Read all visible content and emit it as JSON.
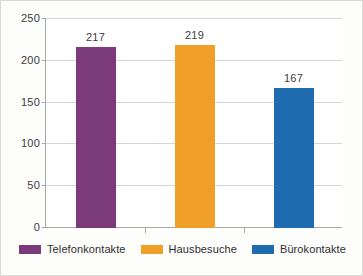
{
  "chart_data": {
    "type": "bar",
    "title": "",
    "subtitle": "",
    "xlabel": "",
    "ylabel": "",
    "categories": [
      "Telefonkontakte",
      "Hausbesuche",
      "Bürokontakte"
    ],
    "values": [
      217,
      219,
      167
    ],
    "value_labels": [
      "217",
      "219",
      "167"
    ],
    "series": [
      {
        "name": "Kontakte",
        "values": [
          217,
          219,
          167
        ]
      }
    ],
    "ylim": [
      0,
      250
    ],
    "ytick_values": [
      0,
      50,
      100,
      150,
      200,
      250
    ],
    "ytick_labels": [
      "0",
      "50",
      "100",
      "150",
      "200",
      "250"
    ],
    "grid": true,
    "grid_axis": "y",
    "legend_position": "bottom",
    "colors": {
      "telefonkontakte": "#7B3B7B",
      "hausbesuche": "#F0A028",
      "burokontakte": "#1F6BB0",
      "gridline": "#D6D6D6",
      "axis": "#A8A8A8",
      "text": "#3B3B3B",
      "background": "#FDFDFC",
      "plot_background": "#FFFFFF"
    }
  },
  "legend": {
    "items": [
      {
        "label": "Telefonkontakte",
        "color": "#7B3B7B"
      },
      {
        "label": "Hausbesuche",
        "color": "#F0A028"
      },
      {
        "label": "Bürokontakte",
        "color": "#1F6BB0"
      }
    ]
  },
  "axis": {
    "y": {
      "ticks": [
        {
          "label": "250",
          "value": 250
        },
        {
          "label": "200",
          "value": 200
        },
        {
          "label": "150",
          "value": 150
        },
        {
          "label": "100",
          "value": 100
        },
        {
          "label": "50",
          "value": 50
        },
        {
          "label": "0",
          "value": 0
        }
      ]
    }
  }
}
